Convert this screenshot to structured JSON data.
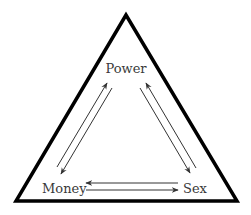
{
  "diagram": {
    "type": "triangle",
    "nodes": [
      {
        "id": "power",
        "label": "Power"
      },
      {
        "id": "money",
        "label": "Money"
      },
      {
        "id": "sex",
        "label": "Sex"
      }
    ],
    "edges": [
      {
        "from": "money",
        "to": "power"
      },
      {
        "from": "power",
        "to": "money"
      },
      {
        "from": "power",
        "to": "sex"
      },
      {
        "from": "sex",
        "to": "power"
      },
      {
        "from": "sex",
        "to": "money"
      },
      {
        "from": "money",
        "to": "sex"
      }
    ],
    "colors": {
      "frame": "#000000",
      "arrows": "#333333",
      "text": "#3a3a3a",
      "background": "#ffffff"
    }
  }
}
